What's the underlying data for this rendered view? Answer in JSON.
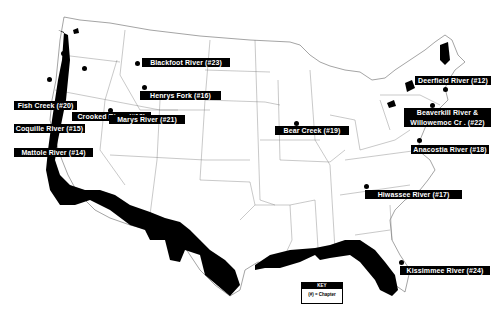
{
  "map": {
    "title": "",
    "labels": [
      {
        "id": "fish-creek",
        "text": "Fish Creek (#20)",
        "x": 14,
        "y": 101,
        "w": 63,
        "dot": [
          60,
          52
        ]
      },
      {
        "id": "crooked-river",
        "text": "Crooked River (#13)",
        "x": 72,
        "y": 112,
        "w": 79,
        "dot": [
          84,
          69
        ]
      },
      {
        "id": "coquille-river",
        "text": "Coquille River (#15)",
        "x": 14,
        "y": 124,
        "w": 71,
        "dot": [
          49,
          79
        ]
      },
      {
        "id": "mattole-river",
        "text": "Mattole River (#14)",
        "x": 14,
        "y": 148,
        "w": 79,
        "dot": [
          45,
          104
        ]
      },
      {
        "id": "blackfoot-river",
        "text": "Blackfoot River (#23)",
        "x": 142,
        "y": 98,
        "w": 88,
        "dot": [
          137,
          63
        ]
      },
      {
        "id": "henrys-fork",
        "text": "Henrys Fork (#16)",
        "x": 140,
        "y": 132,
        "w": 81,
        "dot": [
          144,
          87
        ]
      },
      {
        "id": "marys-river",
        "text": "Marys River (#21)",
        "x": 109,
        "y": 155,
        "w": 76,
        "dot": [
          110,
          110
        ]
      },
      {
        "id": "bear-creek",
        "text": "Bear Creek (#19)",
        "x": 275,
        "y": 126,
        "w": 74,
        "dot": [
          296,
          123
        ]
      },
      {
        "id": "deerfield-river",
        "text": "Deerfield River (#12)",
        "x": 415,
        "y": 76,
        "w": 76,
        "dot": [
          445,
          89
        ]
      },
      {
        "id": "beaverkill-river",
        "text": "Beaverkill River &",
        "text2": "Willowemoc Cr . (#22)",
        "x": 404,
        "y": 108,
        "w": 87,
        "dot": [
          432,
          105
        ]
      },
      {
        "id": "anacostia-river",
        "text": "Anacostia River (#18)",
        "x": 411,
        "y": 145,
        "w": 78,
        "dot": [
          419,
          140
        ]
      },
      {
        "id": "hiwassee-river",
        "text": "Hiwassee River (#17)",
        "x": 365,
        "y": 190,
        "w": 97,
        "dot": [
          366,
          186
        ]
      },
      {
        "id": "kissimmee-river",
        "text": "Kissimmee River (#24)",
        "x": 400,
        "y": 266,
        "w": 90,
        "dot": [
          401,
          262
        ]
      }
    ],
    "key": {
      "title": "KEY",
      "legend": "(#) = Chapter"
    }
  }
}
